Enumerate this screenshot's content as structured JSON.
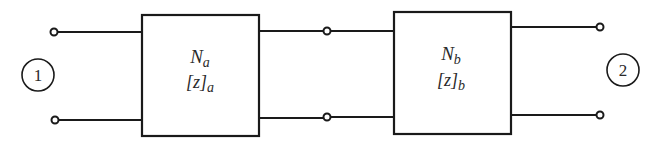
{
  "diagram": {
    "type": "cascade two-port network",
    "networks": [
      {
        "id": "a",
        "name": "N",
        "name_sub": "a",
        "matrix": "[z]",
        "matrix_sub": "a"
      },
      {
        "id": "b",
        "name": "N",
        "name_sub": "b",
        "matrix": "[z]",
        "matrix_sub": "b"
      }
    ],
    "ports": [
      {
        "id": "port-1",
        "label": "1"
      },
      {
        "id": "port-2",
        "label": "2"
      }
    ],
    "colors": {
      "line": "#1a1a1a",
      "text": "#2a2a2a",
      "background": "#ffffff"
    }
  }
}
